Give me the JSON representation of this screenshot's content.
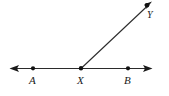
{
  "figure": {
    "kind": "geometry-diagram",
    "background_color": "#ffffff",
    "stroke_color": "#2b2b2b",
    "point_color": "#111111",
    "canvas": {
      "width": 169,
      "height": 96
    },
    "points": [
      {
        "id": "A",
        "label": "A",
        "x": 33,
        "y": 68,
        "label_x": 29,
        "label_y": 75
      },
      {
        "id": "X",
        "label": "X",
        "x": 81,
        "y": 68,
        "label_x": 77,
        "label_y": 75
      },
      {
        "id": "B",
        "label": "B",
        "x": 128,
        "y": 68,
        "label_x": 124,
        "label_y": 75
      },
      {
        "id": "Y",
        "label": "Y",
        "x": 147,
        "y": 6,
        "label_x": 147,
        "label_y": 10
      }
    ],
    "lines": [
      {
        "id": "line-AB",
        "name": "line-ab",
        "x1": 12,
        "y1": 68,
        "x2": 150,
        "y2": 68,
        "arrow_start": true,
        "arrow_end": true
      },
      {
        "id": "ray-XY",
        "name": "ray-xy",
        "x1": 81,
        "y1": 68,
        "x2": 150,
        "y2": 3,
        "arrow_start": false,
        "arrow_end": true
      }
    ]
  }
}
